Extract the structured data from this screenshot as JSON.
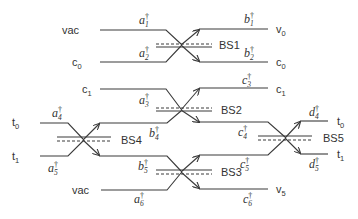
{
  "diagram": {
    "colors": {
      "line": "#3a3a3a",
      "text": "#333333",
      "background": "#ffffff"
    },
    "input_labels": [
      {
        "id": "in-vac-top",
        "text": "vac",
        "x": 62,
        "y": 34
      },
      {
        "id": "in-c0",
        "text": "c",
        "sub": "0",
        "x": 72,
        "y": 66
      },
      {
        "id": "in-c1",
        "text": "c",
        "sub": "1",
        "x": 82,
        "y": 93
      },
      {
        "id": "in-t0",
        "text": "t",
        "sub": "0",
        "x": 12,
        "y": 126
      },
      {
        "id": "in-t1",
        "text": "t",
        "sub": "1",
        "x": 12,
        "y": 160
      },
      {
        "id": "in-vac-bottom",
        "text": "vac",
        "x": 72,
        "y": 194
      }
    ],
    "output_labels": [
      {
        "id": "out-v0",
        "text": "v",
        "sub": "0",
        "x": 276,
        "y": 33
      },
      {
        "id": "out-c0",
        "text": "c",
        "sub": "0",
        "x": 276,
        "y": 66
      },
      {
        "id": "out-c1",
        "text": "c",
        "sub": "1",
        "x": 276,
        "y": 93
      },
      {
        "id": "out-t0",
        "text": "t",
        "sub": "0",
        "x": 337,
        "y": 125
      },
      {
        "id": "out-t1",
        "text": "t",
        "sub": "1",
        "x": 337,
        "y": 158
      },
      {
        "id": "out-v5",
        "text": "v",
        "sub": "5",
        "x": 276,
        "y": 193
      }
    ],
    "operators": [
      {
        "id": "op-a1",
        "base": "a",
        "sub": "1",
        "x": 139,
        "y": 24
      },
      {
        "id": "op-a2",
        "base": "a",
        "sub": "2",
        "x": 139,
        "y": 57
      },
      {
        "id": "op-b1",
        "base": "b",
        "sub": "1",
        "x": 244,
        "y": 23
      },
      {
        "id": "op-b2",
        "base": "b",
        "sub": "2",
        "x": 244,
        "y": 57
      },
      {
        "id": "op-a3",
        "base": "a",
        "sub": "3",
        "x": 139,
        "y": 104
      },
      {
        "id": "op-c3",
        "base": "c",
        "sub": "3",
        "x": 242,
        "y": 84
      },
      {
        "id": "op-a4",
        "base": "a",
        "sub": "4",
        "x": 52,
        "y": 117
      },
      {
        "id": "op-b4",
        "base": "b",
        "sub": "4",
        "x": 149,
        "y": 137
      },
      {
        "id": "op-c4",
        "base": "c",
        "sub": "4",
        "x": 238,
        "y": 136
      },
      {
        "id": "op-d4",
        "base": "d",
        "sub": "4",
        "x": 309,
        "y": 116
      },
      {
        "id": "op-a5",
        "base": "a",
        "sub": "5",
        "x": 48,
        "y": 172
      },
      {
        "id": "op-b5",
        "base": "b",
        "sub": "5",
        "x": 138,
        "y": 170
      },
      {
        "id": "op-c5",
        "base": "c",
        "sub": "5",
        "x": 240,
        "y": 168
      },
      {
        "id": "op-d5",
        "base": "d",
        "sub": "5",
        "x": 309,
        "y": 168
      },
      {
        "id": "op-a6",
        "base": "a",
        "sub": "6",
        "x": 134,
        "y": 203
      },
      {
        "id": "op-c6",
        "base": "c",
        "sub": "6",
        "x": 243,
        "y": 203
      }
    ],
    "dagger": "†",
    "beam_splitters": [
      {
        "id": "BS1",
        "label": "BS1",
        "cx": 181,
        "cy": 45,
        "label_x": 219,
        "label_y": 49
      },
      {
        "id": "BS2",
        "label": "BS2",
        "cx": 181,
        "cy": 110,
        "label_x": 221,
        "label_y": 114
      },
      {
        "id": "BS3",
        "label": "BS3",
        "cx": 181,
        "cy": 172,
        "label_x": 221,
        "label_y": 176
      },
      {
        "id": "BS4",
        "label": "BS4",
        "cx": 83,
        "cy": 140,
        "label_x": 121,
        "label_y": 144
      },
      {
        "id": "BS5",
        "label": "BS5",
        "cx": 285,
        "cy": 138,
        "label_x": 323,
        "label_y": 142
      }
    ]
  }
}
